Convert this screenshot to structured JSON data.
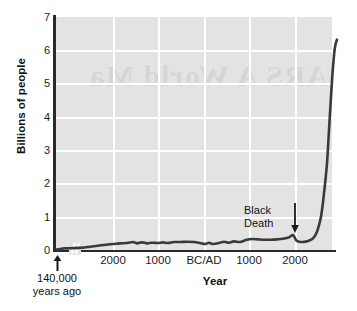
{
  "chart_data": {
    "type": "line",
    "title": "",
    "subtitle": "",
    "xlabel": "Year",
    "ylabel": "Billions of people",
    "ylim": [
      0,
      7
    ],
    "y_ticks": [
      0,
      1,
      2,
      3,
      4,
      5,
      6,
      7
    ],
    "y_tick_labels": [
      "0",
      "1",
      "2",
      "3",
      "4",
      "5",
      "6",
      "7"
    ],
    "x_tick_labels": [
      "2000",
      "1000",
      "BC/AD",
      "1000",
      "2000"
    ],
    "x_tick_positions_px": [
      113,
      158,
      204,
      249,
      295
    ],
    "x_axis_note": "Broken axis: leftmost point is 140,000 years ago, then a break, then a linear scale from about 3000 BC to 2000 AD",
    "grid": true,
    "grid_color": "#ffffff",
    "plot_background": "#e3e3e3",
    "line_color": "#3a3a3a",
    "legend": "none",
    "annotations": [
      {
        "text": "Black Death",
        "lines": [
          "Black",
          "Death"
        ],
        "arrow": "down-arrow-icon",
        "points_to_year": "1347",
        "points_to_value": 0.42
      },
      {
        "text": "140,000 years ago",
        "lines": [
          "140,000",
          "years ago"
        ],
        "arrow": "up-arrow-icon",
        "points_to_value": 0.0
      }
    ],
    "series": [
      {
        "name": "World population",
        "units": "billions",
        "points": [
          {
            "x_px": 57,
            "value": 0.02
          },
          {
            "x_px": 60,
            "value": 0.03
          },
          {
            "x_px": 64,
            "value": 0.05
          },
          {
            "x_px": 68,
            "value": 0.05
          },
          {
            "x_px": 82,
            "value": 0.07
          },
          {
            "x_px": 90,
            "value": 0.1
          },
          {
            "x_px": 98,
            "value": 0.13
          },
          {
            "x_px": 106,
            "value": 0.16
          },
          {
            "x_px": 113,
            "value": 0.18
          },
          {
            "x_px": 120,
            "value": 0.2
          },
          {
            "x_px": 127,
            "value": 0.21
          },
          {
            "x_px": 133,
            "value": 0.24
          },
          {
            "x_px": 137,
            "value": 0.2
          },
          {
            "x_px": 142,
            "value": 0.23
          },
          {
            "x_px": 147,
            "value": 0.2
          },
          {
            "x_px": 152,
            "value": 0.22
          },
          {
            "x_px": 158,
            "value": 0.21
          },
          {
            "x_px": 163,
            "value": 0.23
          },
          {
            "x_px": 168,
            "value": 0.21
          },
          {
            "x_px": 174,
            "value": 0.24
          },
          {
            "x_px": 180,
            "value": 0.24
          },
          {
            "x_px": 187,
            "value": 0.25
          },
          {
            "x_px": 194,
            "value": 0.24
          },
          {
            "x_px": 200,
            "value": 0.21
          },
          {
            "x_px": 205,
            "value": 0.18
          },
          {
            "x_px": 209,
            "value": 0.22
          },
          {
            "x_px": 213,
            "value": 0.18
          },
          {
            "x_px": 219,
            "value": 0.21
          },
          {
            "x_px": 224,
            "value": 0.25
          },
          {
            "x_px": 229,
            "value": 0.22
          },
          {
            "x_px": 234,
            "value": 0.26
          },
          {
            "x_px": 240,
            "value": 0.24
          },
          {
            "x_px": 246,
            "value": 0.3
          },
          {
            "x_px": 252,
            "value": 0.33
          },
          {
            "x_px": 258,
            "value": 0.32
          },
          {
            "x_px": 264,
            "value": 0.31
          },
          {
            "x_px": 270,
            "value": 0.31
          },
          {
            "x_px": 277,
            "value": 0.32
          },
          {
            "x_px": 283,
            "value": 0.34
          },
          {
            "x_px": 289,
            "value": 0.38
          },
          {
            "x_px": 293,
            "value": 0.45
          },
          {
            "x_px": 296,
            "value": 0.3
          },
          {
            "x_px": 299,
            "value": 0.25
          },
          {
            "x_px": 303,
            "value": 0.24
          },
          {
            "x_px": 308,
            "value": 0.27
          },
          {
            "x_px": 313,
            "value": 0.35
          },
          {
            "x_px": 317,
            "value": 0.55
          },
          {
            "x_px": 321,
            "value": 1.0
          },
          {
            "x_px": 324,
            "value": 1.7
          },
          {
            "x_px": 327,
            "value": 2.6
          },
          {
            "x_px": 329,
            "value": 3.6
          },
          {
            "x_px": 331,
            "value": 4.6
          },
          {
            "x_px": 333,
            "value": 5.5
          },
          {
            "x_px": 335,
            "value": 6.1
          },
          {
            "x_px": 337,
            "value": 6.32
          }
        ]
      }
    ],
    "watermark_text": "ARS A World Ma"
  },
  "axis": {
    "y_title": "Billions of people",
    "x_title": "Year"
  },
  "origin_note": {
    "line1": "140,000",
    "line2": "years ago"
  },
  "black_death": {
    "line1": "Black",
    "line2": "Death"
  }
}
